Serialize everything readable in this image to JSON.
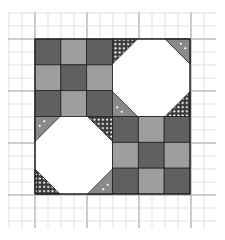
{
  "diagram": {
    "type": "quilt-block",
    "grid": {
      "x0": 8,
      "y0": 12,
      "x1": 216,
      "y1": 228,
      "cell": 13,
      "thin_color": "#d9d9d9",
      "thick_color": "#bdbdbd",
      "thick_every": 4
    },
    "block": {
      "x": 35,
      "y": 39,
      "size": 155,
      "outline": "#222222",
      "colors": {
        "dark": "#606060",
        "medium": "#9e9e9e",
        "white": "#ffffff",
        "corner_dark": "#3a3a3a",
        "corner_medium": "#8a8a8a",
        "dot": "#ffffff"
      },
      "quadrants": [
        {
          "name": "nine-patch-top-left",
          "kind": "ninepatch",
          "col": 0,
          "row": 0,
          "pattern": [
            [
              "dark",
              "medium",
              "dark"
            ],
            [
              "medium",
              "dark",
              "medium"
            ],
            [
              "dark",
              "medium",
              "dark"
            ]
          ]
        },
        {
          "name": "snowball-top-right",
          "kind": "snowball",
          "col": 1,
          "row": 0,
          "corners": {
            "tl": "dotted",
            "tr": "medium",
            "bl": "medium",
            "br": "dotted"
          }
        },
        {
          "name": "snowball-bottom-left",
          "kind": "snowball",
          "col": 0,
          "row": 1,
          "corners": {
            "tl": "medium",
            "tr": "dotted",
            "bl": "dotted",
            "br": "medium"
          }
        },
        {
          "name": "nine-patch-bottom-right",
          "kind": "ninepatch",
          "col": 1,
          "row": 1,
          "pattern": [
            [
              "dark",
              "medium",
              "dark"
            ],
            [
              "medium",
              "dark",
              "medium"
            ],
            [
              "dark",
              "medium",
              "dark"
            ]
          ]
        }
      ],
      "corner_leg": 25
    }
  }
}
